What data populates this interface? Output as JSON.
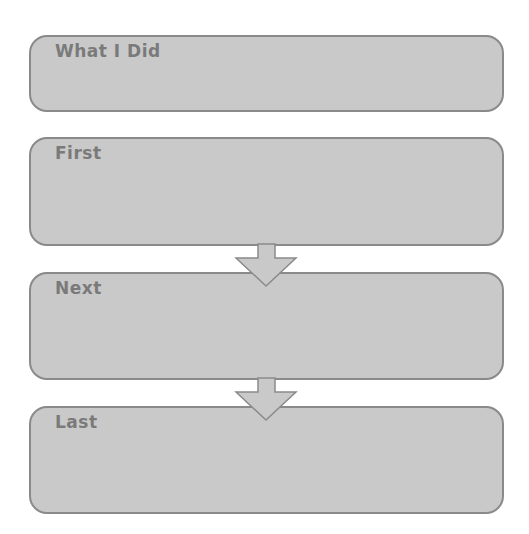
{
  "diagram": {
    "type": "sequence-organizer",
    "boxes": [
      {
        "label": "What I Did"
      },
      {
        "label": "First"
      },
      {
        "label": "Next"
      },
      {
        "label": "Last"
      }
    ],
    "colors": {
      "box_fill": "#c9c9c9",
      "box_border": "#8a8a8a",
      "label_text": "#7a7a7a",
      "arrow_fill": "#c9c9c9",
      "arrow_stroke": "#8a8a8a",
      "background": "#ffffff"
    }
  }
}
